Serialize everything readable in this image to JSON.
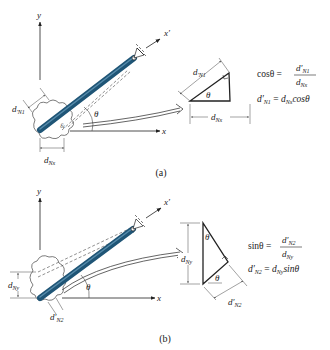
{
  "figure": {
    "panels": [
      {
        "id": "a",
        "caption": "(a)",
        "axis_x": "x",
        "axis_y": "y",
        "axis_xprime": "x′",
        "angle": "θ",
        "dim_rotated": "d′N1",
        "dim_rotated_base": "d",
        "dim_rotated_sub": "N1",
        "dim_axis_base": "d",
        "dim_axis_sub": "Nx",
        "triangle_angle": "θ",
        "eq1_lhs": "cosθ =",
        "eq1_num_base": "d′",
        "eq1_num_sub": "N1",
        "eq1_den_base": "d",
        "eq1_den_sub": "Nx",
        "eq2_lhs_base": "d′",
        "eq2_lhs_sub": "N1",
        "eq2_eq": " = ",
        "eq2_rhs_base": "d",
        "eq2_rhs_sub": "Nx",
        "eq2_rhs_fn": "cosθ"
      },
      {
        "id": "b",
        "caption": "(b)",
        "axis_x": "x",
        "axis_y": "y",
        "axis_xprime": "x′",
        "angle": "θ",
        "dim_rotated_base": "d′",
        "dim_rotated_sub": "N2",
        "dim_axis_base": "d",
        "dim_axis_sub": "Ny",
        "triangle_angle_top": "θ",
        "triangle_angle_bottom": "θ",
        "eq1_lhs": "sinθ =",
        "eq1_num_base": "d′",
        "eq1_num_sub": "N2",
        "eq1_den_base": "d",
        "eq1_den_sub": "Ny",
        "eq2_lhs_base": "d′",
        "eq2_lhs_sub": "N2",
        "eq2_eq": " = ",
        "eq2_rhs_base": "d",
        "eq2_rhs_sub": "Ny",
        "eq2_rhs_fn": "sinθ"
      }
    ],
    "colors": {
      "bar": "#2f6f96",
      "bar_highlight": "#6fa3c2",
      "line": "#222222",
      "dim_line": "#444444"
    }
  }
}
